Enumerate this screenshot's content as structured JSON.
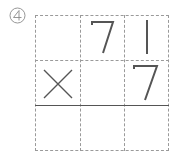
{
  "problem_number": "4",
  "problem_symbol": "④",
  "grid": {
    "rows": 3,
    "cols": 3,
    "cells": [
      [
        "",
        "7",
        "1"
      ],
      [
        "×",
        "",
        "7"
      ],
      [
        "",
        "",
        ""
      ]
    ]
  },
  "colors": {
    "ink": "#555555",
    "dashed": "#9a9a9a"
  }
}
